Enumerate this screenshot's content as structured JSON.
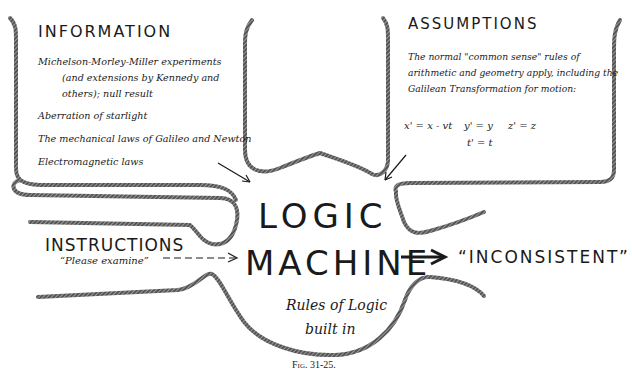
{
  "diagram": {
    "caption": "Fig. 31-25.",
    "information": {
      "title": "INFORMATION",
      "items": [
        "Michelson-Morley-Miller experiments",
        "(and extensions by Kennedy and",
        "others); null result",
        "Aberration of starlight",
        "The mechanical laws of Galileo and Newton",
        "Electromagnetic laws"
      ]
    },
    "assumptions": {
      "title": "ASSUMPTIONS",
      "lines": [
        "The normal \"common sense\" rules of",
        "arithmetic and geometry apply, including the",
        "Galilean Transformation for motion:"
      ],
      "equations": {
        "x": "x' = x - vt",
        "y": "y' = y",
        "z": "z' = z",
        "t": "t' = t"
      }
    },
    "machine": {
      "line1": "LOGIC",
      "line2": "MACHINE",
      "rules1": "Rules of Logic",
      "rules2": "built in"
    },
    "instructions": {
      "title": "INSTRUCTIONS",
      "sub": "“Please examine”"
    },
    "output": "“INCONSISTENT”"
  }
}
